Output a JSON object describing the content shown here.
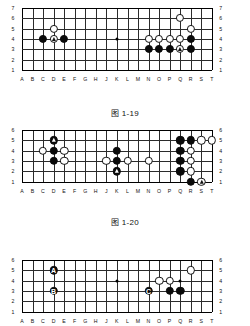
{
  "page": {
    "column_labels": [
      "A",
      "B",
      "C",
      "D",
      "E",
      "F",
      "G",
      "H",
      "J",
      "K",
      "L",
      "M",
      "N",
      "O",
      "P",
      "Q",
      "R",
      "S",
      "T"
    ]
  },
  "diagrams": [
    {
      "id": "diagram-1-19",
      "caption": "图 1-19",
      "rows": [
        7,
        6,
        5,
        4,
        3,
        2,
        1
      ],
      "row_labels": [
        "7",
        "6",
        "5",
        "4",
        "3",
        "2",
        "1"
      ],
      "hoshi": [
        {
          "col": "K",
          "row": 4
        }
      ],
      "stones": [
        {
          "color": "black",
          "col": "C",
          "row": 4,
          "mark": "",
          "label": ""
        },
        {
          "color": "white",
          "col": "D",
          "row": 5,
          "mark": "",
          "label": ""
        },
        {
          "color": "white",
          "col": "D",
          "row": 4,
          "mark": "triangle",
          "label": ""
        },
        {
          "color": "black",
          "col": "E",
          "row": 4,
          "mark": "",
          "label": ""
        },
        {
          "color": "white",
          "col": "Q",
          "row": 6,
          "mark": "",
          "label": ""
        },
        {
          "color": "white",
          "col": "R",
          "row": 5,
          "mark": "",
          "label": ""
        },
        {
          "color": "white",
          "col": "N",
          "row": 4,
          "mark": "",
          "label": ""
        },
        {
          "color": "white",
          "col": "O",
          "row": 4,
          "mark": "",
          "label": ""
        },
        {
          "color": "white",
          "col": "P",
          "row": 4,
          "mark": "",
          "label": ""
        },
        {
          "color": "white",
          "col": "Q",
          "row": 4,
          "mark": "",
          "label": ""
        },
        {
          "color": "black",
          "col": "R",
          "row": 4,
          "mark": "",
          "label": ""
        },
        {
          "color": "black",
          "col": "N",
          "row": 3,
          "mark": "",
          "label": ""
        },
        {
          "color": "black",
          "col": "O",
          "row": 3,
          "mark": "",
          "label": ""
        },
        {
          "color": "black",
          "col": "P",
          "row": 3,
          "mark": "",
          "label": ""
        },
        {
          "color": "white",
          "col": "Q",
          "row": 3,
          "mark": "triangle",
          "label": ""
        },
        {
          "color": "black",
          "col": "R",
          "row": 3,
          "mark": "",
          "label": ""
        }
      ]
    },
    {
      "id": "diagram-1-20",
      "caption": "图 1-20",
      "rows": [
        6,
        5,
        4,
        3,
        2,
        1
      ],
      "row_labels": [
        "6",
        "5",
        "4",
        "3",
        "2",
        "1"
      ],
      "hoshi": [
        {
          "col": "K",
          "row": 4
        }
      ],
      "stones": [
        {
          "color": "black",
          "col": "D",
          "row": 5,
          "mark": "triangle",
          "label": ""
        },
        {
          "color": "white",
          "col": "C",
          "row": 4,
          "mark": "",
          "label": ""
        },
        {
          "color": "black",
          "col": "D",
          "row": 4,
          "mark": "",
          "label": ""
        },
        {
          "color": "white",
          "col": "E",
          "row": 4,
          "mark": "",
          "label": ""
        },
        {
          "color": "black",
          "col": "D",
          "row": 3,
          "mark": "",
          "label": ""
        },
        {
          "color": "white",
          "col": "E",
          "row": 3,
          "mark": "",
          "label": ""
        },
        {
          "color": "black",
          "col": "K",
          "row": 4,
          "mark": "",
          "label": ""
        },
        {
          "color": "white",
          "col": "J",
          "row": 3,
          "mark": "",
          "label": ""
        },
        {
          "color": "black",
          "col": "K",
          "row": 3,
          "mark": "",
          "label": ""
        },
        {
          "color": "white",
          "col": "L",
          "row": 3,
          "mark": "",
          "label": ""
        },
        {
          "color": "white",
          "col": "N",
          "row": 3,
          "mark": "",
          "label": ""
        },
        {
          "color": "black",
          "col": "K",
          "row": 2,
          "mark": "triangle",
          "label": ""
        },
        {
          "color": "black",
          "col": "Q",
          "row": 5,
          "mark": "",
          "label": ""
        },
        {
          "color": "black",
          "col": "R",
          "row": 5,
          "mark": "",
          "label": ""
        },
        {
          "color": "white",
          "col": "S",
          "row": 5,
          "mark": "",
          "label": ""
        },
        {
          "color": "white",
          "col": "T",
          "row": 5,
          "mark": "",
          "label": ""
        },
        {
          "color": "black",
          "col": "Q",
          "row": 4,
          "mark": "",
          "label": ""
        },
        {
          "color": "white",
          "col": "R",
          "row": 4,
          "mark": "",
          "label": ""
        },
        {
          "color": "black",
          "col": "Q",
          "row": 3,
          "mark": "",
          "label": ""
        },
        {
          "color": "white",
          "col": "R",
          "row": 3,
          "mark": "",
          "label": ""
        },
        {
          "color": "black",
          "col": "Q",
          "row": 2,
          "mark": "",
          "label": ""
        },
        {
          "color": "white",
          "col": "R",
          "row": 2,
          "mark": "",
          "label": ""
        },
        {
          "color": "black",
          "col": "R",
          "row": 1,
          "mark": "",
          "label": ""
        },
        {
          "color": "white",
          "col": "S",
          "row": 1,
          "mark": "triangle",
          "label": ""
        }
      ]
    },
    {
      "id": "diagram-3",
      "caption": "",
      "rows": [
        6,
        5,
        4,
        3,
        2,
        1
      ],
      "row_labels": [
        "6",
        "5",
        "4",
        "3",
        "2",
        "1"
      ],
      "hoshi": [
        {
          "col": "K",
          "row": 4
        },
        {
          "col": "Q",
          "row": 4
        }
      ],
      "stones": [
        {
          "color": "black",
          "col": "D",
          "row": 5,
          "mark": "",
          "label": "A"
        },
        {
          "color": "black",
          "col": "D",
          "row": 3,
          "mark": "",
          "label": "B"
        },
        {
          "color": "white",
          "col": "R",
          "row": 5,
          "mark": "",
          "label": ""
        },
        {
          "color": "white",
          "col": "O",
          "row": 4,
          "mark": "",
          "label": ""
        },
        {
          "color": "white",
          "col": "P",
          "row": 4,
          "mark": "",
          "label": ""
        },
        {
          "color": "black",
          "col": "N",
          "row": 3,
          "mark": "",
          "label": "C"
        },
        {
          "color": "black",
          "col": "P",
          "row": 3,
          "mark": "",
          "label": ""
        },
        {
          "color": "black",
          "col": "Q",
          "row": 3,
          "mark": "",
          "label": ""
        }
      ]
    }
  ],
  "colors": {
    "black_stone": "#0a0a0a",
    "white_stone": "#ffffff",
    "grid_line": "#2b2b2b",
    "board_bg": "#ffffff",
    "text": "#111111"
  }
}
